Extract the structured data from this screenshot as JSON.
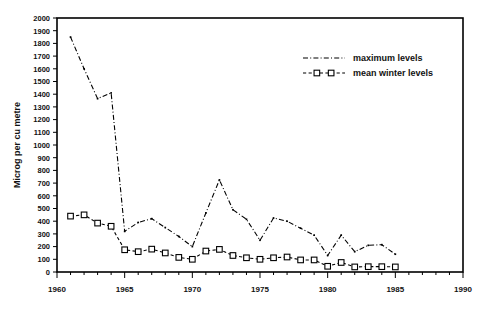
{
  "chart_data": {
    "type": "line",
    "title": "",
    "xlabel": "",
    "ylabel": "Microg per cu metre",
    "xlim": [
      1960,
      1990
    ],
    "ylim": [
      0,
      2000
    ],
    "grid": false,
    "legend_position": "top-right",
    "x_ticks": [
      1960,
      1965,
      1970,
      1975,
      1980,
      1985,
      1990
    ],
    "x_tick_labels": [
      "1960",
      "1965",
      "1970",
      "1975",
      "1980",
      "1985",
      "1990"
    ],
    "x_minor_tick_step": 1,
    "y_ticks": [
      0,
      100,
      200,
      300,
      400,
      500,
      600,
      700,
      800,
      900,
      1000,
      1100,
      1200,
      1300,
      1400,
      1500,
      1600,
      1700,
      1800,
      1900,
      2000
    ],
    "y_tick_labels": [
      "0",
      "100",
      "200",
      "300",
      "400",
      "500",
      "600",
      "700",
      "800",
      "900",
      "1000",
      "1100",
      "1200",
      "1300",
      "1400",
      "1500",
      "1600",
      "1700",
      "1800",
      "1900",
      "2000"
    ],
    "x": [
      1961,
      1962,
      1963,
      1964,
      1965,
      1966,
      1967,
      1968,
      1969,
      1970,
      1971,
      1972,
      1973,
      1974,
      1975,
      1976,
      1977,
      1978,
      1979,
      1980,
      1981,
      1982,
      1983,
      1984,
      1985
    ],
    "series": [
      {
        "name": "maximum levels",
        "style": "dash-dot",
        "marker": "none",
        "values": [
          1850,
          1600,
          1365,
          1410,
          320,
          390,
          420,
          350,
          280,
          200,
          465,
          725,
          490,
          415,
          250,
          425,
          400,
          345,
          290,
          130,
          290,
          160,
          210,
          215,
          140
        ]
      },
      {
        "name": "mean winter levels",
        "style": "dashed",
        "marker": "open-square",
        "values": [
          440,
          450,
          385,
          360,
          175,
          160,
          180,
          150,
          115,
          100,
          165,
          178,
          130,
          112,
          100,
          112,
          118,
          95,
          95,
          45,
          75,
          40,
          42,
          42,
          40
        ]
      }
    ]
  },
  "legend": {
    "entries": [
      {
        "label": "maximum levels",
        "style": "dash-dot"
      },
      {
        "label": "mean winter levels",
        "style": "dashed-square"
      }
    ]
  },
  "axes": {
    "y_title": "Microg per cu metre"
  },
  "colors": {
    "line": "#000000",
    "background": "#ffffff",
    "text": "#111111"
  }
}
